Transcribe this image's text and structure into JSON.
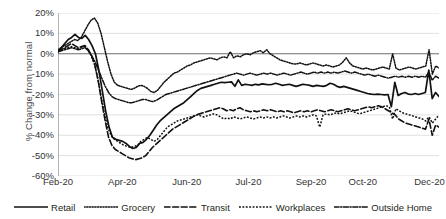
{
  "chart_data": {
    "type": "line",
    "title": "",
    "xlabel": "",
    "ylabel": "% Change from normal",
    "ylim": [
      -60,
      20
    ],
    "ytick_labels": [
      "20%",
      "10%",
      "0%",
      "-10%",
      "-20%",
      "-30%",
      "-40%",
      "-50%",
      "-60%"
    ],
    "ytick_values": [
      20,
      10,
      0,
      -10,
      -20,
      -30,
      -40,
      -50,
      -60
    ],
    "xtick_labels": [
      "Feb-20",
      "Apr-20",
      "Jun-20",
      "Jul-20",
      "Sep-20",
      "Oct-20",
      "Dec-20"
    ],
    "xtick_positions": [
      0,
      16.9,
      33.8,
      50.0,
      66.4,
      80.0,
      97.5
    ],
    "grid": true,
    "zero_line": true,
    "legend_position": "bottom",
    "x_start": "2020-02-15",
    "x_end": "2020-12-31",
    "series": [
      {
        "name": "Retail",
        "style": "solid",
        "color": "#111111",
        "values": [
          1,
          3,
          5,
          7,
          8,
          9.5,
          8,
          7.5,
          9,
          7,
          4,
          0,
          -8,
          -18,
          -28,
          -36,
          -41,
          -42,
          -42.5,
          -43,
          -44,
          -45.5,
          -46.5,
          -46,
          -44,
          -43.5,
          -42,
          -40,
          -37.5,
          -35,
          -33,
          -31.5,
          -30,
          -28.5,
          -27,
          -26,
          -25,
          -24,
          -22.5,
          -21,
          -19.5,
          -18,
          -17,
          -16.5,
          -16,
          -15.5,
          -15,
          -14.5,
          -14,
          -14.2,
          -14,
          -13.8,
          -16,
          -12.8,
          -15.5,
          -15,
          -15.2,
          -15.5,
          -15,
          -15.3,
          -14.8,
          -15,
          -15.2,
          -15,
          -14.5,
          -15,
          -15.5,
          -15.2,
          -15,
          -15.5,
          -16,
          -15.5,
          -15,
          -15.2,
          -15.5,
          -16,
          -15.5,
          -15.8,
          -16,
          -15.5,
          -14.5,
          -15,
          -16,
          -16.5,
          -16,
          -16.5,
          -17,
          -17.5,
          -18,
          -18.5,
          -19,
          -19.5,
          -19.8,
          -20,
          -19.8,
          -20,
          -20.2,
          -20,
          -26,
          -14,
          -20.5,
          -19.5,
          -19,
          -19.8,
          -20,
          -19.5,
          -20,
          -19.5,
          -19,
          -8,
          -22,
          -19,
          -21
        ]
      },
      {
        "name": "Grocery",
        "style": "dotted",
        "color": "#111111",
        "values": [
          2,
          3,
          4,
          5,
          6,
          7,
          6.5,
          8,
          11,
          14,
          16.5,
          17.5,
          15,
          10,
          3,
          -4,
          -10,
          -14,
          -15.5,
          -16,
          -16.5,
          -17,
          -17.5,
          -17,
          -16,
          -15.5,
          -16,
          -17,
          -18.5,
          -19,
          -18,
          -16,
          -14,
          -12.5,
          -11,
          -9.5,
          -9,
          -8,
          -7,
          -6,
          -5.5,
          -4.5,
          -4,
          -3.5,
          -3,
          -2.5,
          -2,
          -2.5,
          -3,
          -2,
          -1.5,
          -2,
          1,
          -2,
          -1,
          -1.5,
          -0.5,
          0,
          -0.5,
          0.5,
          1,
          1.5,
          0.5,
          2,
          0,
          -1,
          -2,
          -3,
          -3.5,
          -4,
          -4.5,
          -5,
          -5,
          -4.5,
          -5,
          -5.5,
          -5,
          -4.5,
          -5,
          -5.5,
          -6,
          -5.5,
          -6,
          -6.5,
          -6,
          -5.5,
          -4,
          -2,
          -4.5,
          -6,
          -6.5,
          -7,
          -7.5,
          -7,
          -7.5,
          -8,
          -7.5,
          -7,
          -6.5,
          -7,
          -7.5,
          0,
          -7,
          -8,
          -7.5,
          -7,
          -6.5,
          -7,
          -7.5,
          -7,
          -6.5,
          -6,
          2,
          -10,
          -6,
          -7
        ]
      },
      {
        "name": "Transit",
        "style": "dashed",
        "color": "#111111",
        "values": [
          1,
          2,
          3,
          4,
          5,
          4,
          3,
          3.5,
          4,
          2,
          -1,
          -6,
          -14,
          -24,
          -33,
          -41,
          -45,
          -47,
          -48,
          -49,
          -50,
          -51,
          -51.5,
          -52,
          -51.5,
          -51,
          -50,
          -48,
          -46,
          -44.5,
          -43,
          -41.5,
          -40,
          -38.5,
          -37,
          -36,
          -35,
          -34,
          -33,
          -32,
          -31,
          -30,
          -29.5,
          -29,
          -28.5,
          -28,
          -27.5,
          -27,
          -26.5,
          -27,
          -28,
          -27.5,
          -28,
          -27,
          -26.5,
          -27.5,
          -28,
          -28.5,
          -28,
          -28.5,
          -28,
          -27.5,
          -28,
          -27.5,
          -28,
          -28.5,
          -28,
          -28.5,
          -28,
          -28.5,
          -29,
          -28.5,
          -28,
          -28.5,
          -28,
          -28.5,
          -28,
          -27.5,
          -28,
          -28.5,
          -28,
          -27.5,
          -28,
          -28.5,
          -28,
          -27.5,
          -27,
          -27.5,
          -28,
          -27.5,
          -27,
          -26.5,
          -26,
          -26.5,
          -26,
          -25.5,
          -26,
          -27,
          -28,
          -29,
          -30,
          -32,
          -33,
          -34,
          -34.5,
          -35,
          -35.5,
          -36,
          -36.5,
          -37,
          -32,
          -40,
          -35,
          -36
        ]
      },
      {
        "name": "Workplaces",
        "style": "finedot",
        "color": "#111111",
        "values": [
          1,
          2,
          2.5,
          3,
          3.5,
          3,
          2.5,
          3,
          3.5,
          2,
          -1,
          -5,
          -12,
          -21,
          -29,
          -36,
          -40,
          -42,
          -43,
          -44,
          -45,
          -45.5,
          -46,
          -45.5,
          -45,
          -43,
          -42,
          -41,
          -42,
          -43,
          -42,
          -40,
          -38,
          -36,
          -35,
          -34,
          -33,
          -32.5,
          -32,
          -31.5,
          -31,
          -30.5,
          -30,
          -30.5,
          -31,
          -30.5,
          -30,
          -29.5,
          -30,
          -31,
          -32,
          -31.5,
          -32,
          -31,
          -31.5,
          -32,
          -31.5,
          -31,
          -31.5,
          -32,
          -31.5,
          -31,
          -31.5,
          -31,
          -31.5,
          -31,
          -31.5,
          -31,
          -30.5,
          -31,
          -31.5,
          -31,
          -30.5,
          -31,
          -30.5,
          -31,
          -30.5,
          -30,
          -30.5,
          -36,
          -30,
          -29.5,
          -30,
          -29.5,
          -29,
          -29.5,
          -29,
          -28.5,
          -28,
          -28.5,
          -29,
          -29.5,
          -29,
          -28.5,
          -28,
          -27.5,
          -27,
          -26.5,
          -26,
          -25.5,
          -26,
          -32,
          -27,
          -28,
          -29,
          -29.5,
          -30,
          -30.5,
          -31,
          -31.5,
          -32,
          -33,
          -31,
          -34,
          -32,
          -30
        ]
      },
      {
        "name": "Outside Home",
        "style": "dashdot",
        "color": "#111111",
        "values": [
          1,
          1.5,
          2,
          2.5,
          3,
          2.5,
          2,
          2.5,
          3,
          1.5,
          -1,
          -4,
          -8,
          -12,
          -16,
          -19,
          -21,
          -22,
          -22.5,
          -23,
          -23.5,
          -24,
          -24,
          -23.5,
          -23,
          -22.5,
          -22.5,
          -23,
          -23.5,
          -23,
          -22,
          -21,
          -20,
          -19.5,
          -19,
          -18.5,
          -18,
          -17.5,
          -17,
          -16.5,
          -16,
          -15.5,
          -15,
          -14.5,
          -14,
          -13.5,
          -13,
          -12.5,
          -12,
          -11.5,
          -11,
          -10.5,
          -10,
          -9.5,
          -10,
          -10.5,
          -10,
          -9.5,
          -10,
          -10.5,
          -10,
          -9.5,
          -10,
          -9.5,
          -10,
          -10.5,
          -10,
          -9.5,
          -10,
          -10.5,
          -10,
          -9.5,
          -9,
          -9.5,
          -10,
          -9.5,
          -9,
          -9.5,
          -9,
          -9.5,
          -9,
          -9.5,
          -9,
          -9.5,
          -9,
          -8.5,
          -9,
          -9.5,
          -9,
          -9.5,
          -10,
          -10.5,
          -10,
          -10.5,
          -11,
          -10.5,
          -11,
          -11.5,
          -12,
          -11.5,
          -11,
          -11.5,
          -11,
          -11.5,
          -11,
          -11.5,
          -11,
          -11.5,
          -11,
          -11.5,
          -9,
          -13,
          -11,
          -12
        ]
      }
    ]
  },
  "legend": {
    "items": [
      {
        "label": "Retail",
        "style": "solid"
      },
      {
        "label": "Grocery",
        "style": "dotted"
      },
      {
        "label": "Transit",
        "style": "dashed"
      },
      {
        "label": "Workplaces",
        "style": "finedot"
      },
      {
        "label": "Outside Home",
        "style": "dashdot"
      }
    ]
  }
}
